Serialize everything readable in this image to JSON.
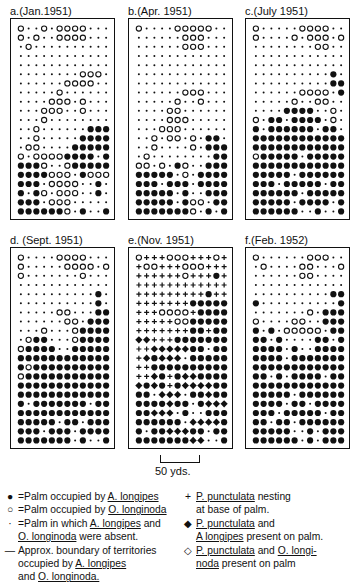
{
  "figure": {
    "panels": [
      {
        "id": "a",
        "title": "a.(Jan.1951)",
        "x": 10,
        "y": 18,
        "grid": [
          "o..o.oooo...",
          "o.o..oooo...",
          ".o..........",
          "............",
          "............",
          "........ooo.",
          "......oooo..",
          ".....o......",
          "....ooo.o...",
          "...ooo..o...",
          "...o........",
          "..o......###",
          "..o.....####",
          ".oo....#####",
          "o.oooo####.#",
          "###o..o#####",
          "####ooo.#ooo",
          "###.oooo..#.",
          "#.#o.ooo..#.",
          "###.ooo.....",
          "######o.#..#"
        ]
      },
      {
        "id": "b",
        "title": "b.(Apr. 1951)",
        "x": 128,
        "y": 18,
        "grid": [
          "o....ooooo..",
          "......ooo...",
          "......ooo...",
          "............",
          "............",
          "............",
          "............",
          "......ooo...",
          ".....o..o...",
          "....oo......",
          "....ooo.....",
          "...ooo......",
          "..o.oo.o.##.",
          "..o....o.###",
          ".o........##",
          "oo.o.#o..###",
          "#####.o.####",
          "###.###.####",
          "#####.#..###",
          "#####.#oo.##",
          "#######o.#.#"
        ]
      },
      {
        "id": "c",
        "title": "c.(July 1951)",
        "x": 245,
        "y": 18,
        "grid": [
          "o.....oooo..",
          "o....o.ooo.o",
          "........oo..",
          "............",
          "............",
          "..........#.",
          "..........##",
          "......oooo.#",
          ".....o..oo..",
          "....####..o.",
          "o.##.####.o.",
          "#.######.##.",
          "############",
          "############",
          "o#####.#####",
          "############",
          "#####.######",
          "###.#####.##",
          "######.#####",
          "#####.####.#",
          "######..#..#"
        ]
      },
      {
        "id": "d",
        "title": "d. (Sept. 1951)",
        "x": 10,
        "y": 247,
        "grid": [
          "o....oooo...",
          "o.....oooo.o",
          "o.......o...",
          "............",
          "..........#.",
          "..........#.",
          ".....oo...##",
          "......oo.###",
          "...o...o####",
          ".o##...o####",
          "o####..#####",
          "############",
          "#o##########",
          "o###########",
          "############",
          "############",
          "#.#######.##",
          "############",
          "#####.##.###",
          "###.###.####",
          "#######.#..#"
        ]
      },
      {
        "id": "e",
        "title": "e.(Nov. 1951)",
        "x": 128,
        "y": 247,
        "grid": [
          "o+++ooo+++o+",
          "+oo+++ooo+++",
          "++++++o+++#+",
          "++++++++++++",
          "+++++++++#++",
          "+++++++#####",
          "+++oooo+####",
          "+++++oo#####",
          "+++++++##+##",
          "DD+++#######",
          "++DDDDD##.##",
          "+D#DDD.#####",
          "++##########",
          "++D#+#DD####",
          "D#D#+#DDDD##",
          "##.DDD.##D##",
          "####D##.#DDD",
          "##DDD.#..###",
          "######.DDDD#",
          "#.##DDD##.##",
          "#######DD..#"
        ]
      },
      {
        "id": "f",
        "title": "f.(Feb. 1952)",
        "x": 245,
        "y": 247,
        "grid": [
          "o......ooo..",
          ".o....oo...o",
          "......oo....",
          "............",
          "..........##",
          "#..........#",
          ".......o.###",
          "o....oo..###",
          "#.#.ooooo.##",
          "##.#....##.#",
          "####.#..####",
          "####.#######",
          "############",
          "##.#.####.##",
          "############",
          "#####.######",
          "####.##.####",
          "###.#####.##",
          "##.##.######",
          "#####..#.###",
          "######.#.###"
        ]
      }
    ],
    "panel_width": 105,
    "panel_height": 202,
    "scale_bar": {
      "label": "50 yds."
    }
  },
  "legend": {
    "left": [
      {
        "symbol": "●",
        "parts": [
          {
            "t": "=Palm occupied by "
          },
          {
            "t": "A. longipes",
            "u": true
          }
        ]
      },
      {
        "symbol": "○",
        "parts": [
          {
            "t": "=Palm occupied by "
          },
          {
            "t": "O. longinoda",
            "u": true
          }
        ]
      },
      {
        "symbol": "·",
        "parts": [
          {
            "t": "=Palm in which "
          },
          {
            "t": "A. longipes",
            "u": true
          },
          {
            "t": " and"
          }
        ]
      },
      {
        "symbol": "",
        "parts": [
          {
            "t": "O. longinoda",
            "u": true
          },
          {
            "t": " were absent."
          }
        ]
      },
      {
        "symbol": "—",
        "parts": [
          {
            "t": "Approx. boundary of territories"
          }
        ]
      },
      {
        "symbol": "",
        "parts": [
          {
            "t": "occupied by "
          },
          {
            "t": "A. longipes",
            "u": true
          }
        ]
      },
      {
        "symbol": "",
        "parts": [
          {
            "t": "and  "
          },
          {
            "t": "O. longinoda.",
            "u": true
          }
        ]
      }
    ],
    "right": [
      {
        "symbol": "+",
        "parts": [
          {
            "t": "P. punctulata",
            "u": true
          },
          {
            "t": "  nesting"
          }
        ]
      },
      {
        "symbol": "",
        "parts": [
          {
            "t": "at base of  palm."
          }
        ]
      },
      {
        "symbol": "◆",
        "parts": [
          {
            "t": "P. punctulata",
            "u": true
          },
          {
            "t": "  and"
          }
        ]
      },
      {
        "symbol": "",
        "parts": [
          {
            "t": "A longipes",
            "u": true
          },
          {
            "t": " present on palm."
          }
        ]
      },
      {
        "symbol": "◇",
        "parts": [
          {
            "t": "P. punctulata",
            "u": true
          },
          {
            "t": " and "
          },
          {
            "t": "O. longi-",
            "u": true
          }
        ]
      },
      {
        "symbol": "",
        "parts": [
          {
            "t": "noda",
            "u": true
          },
          {
            "t": " present on palm"
          }
        ]
      }
    ]
  }
}
